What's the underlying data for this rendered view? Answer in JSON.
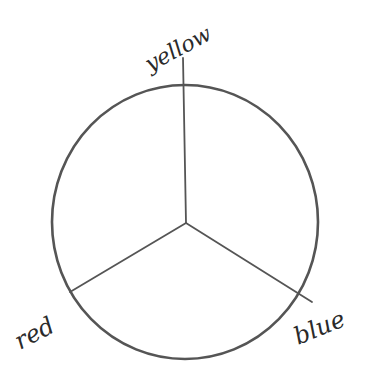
{
  "diagram": {
    "type": "color-wheel-sketch",
    "style": "hand-drawn pencil",
    "circle": {
      "cx": 185,
      "cy": 222,
      "rx": 133,
      "ry": 137,
      "stroke": "#5a5a5a"
    },
    "center": {
      "x": 186,
      "y": 223
    },
    "spokes": [
      {
        "name": "yellow",
        "x2": 183,
        "y2": 58
      },
      {
        "name": "red",
        "x2": 70,
        "y2": 292
      },
      {
        "name": "blue",
        "x2": 312,
        "y2": 302
      }
    ],
    "labels": {
      "yellow": "yellow",
      "red": "red",
      "blue": "blue"
    }
  }
}
